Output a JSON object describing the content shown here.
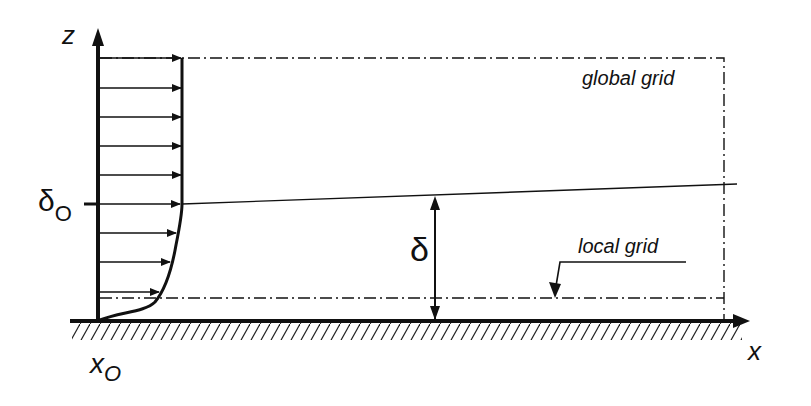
{
  "diagram": {
    "type": "boundary-layer grid schematic",
    "labels": {
      "z_axis": "z",
      "x_axis": "x",
      "x0_main": "x",
      "x0_sub": "O",
      "delta0_main": "δ",
      "delta0_sub": "O",
      "delta": "δ",
      "global_grid": "global grid",
      "local_grid": "local grid"
    },
    "velocity_profile": {
      "arrow_rows_y": [
        58,
        88,
        117,
        146,
        175,
        204,
        233,
        262,
        292
      ],
      "arrow_tips_x": [
        182,
        182,
        182,
        182,
        182,
        180,
        174,
        164,
        150
      ]
    },
    "colors": {
      "ink": "#111111",
      "background": "#ffffff"
    }
  }
}
